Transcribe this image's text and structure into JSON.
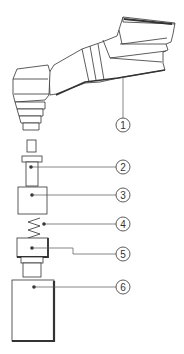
{
  "diagram": {
    "type": "exploded-assembly",
    "stroke_color": "#333333",
    "background": "#ffffff",
    "callouts": [
      {
        "id": 1,
        "label": "1",
        "target": "handpiece-body"
      },
      {
        "id": 2,
        "label": "2",
        "target": "push-button-cap"
      },
      {
        "id": 3,
        "label": "3",
        "target": "square-block"
      },
      {
        "id": 4,
        "label": "4",
        "target": "spring"
      },
      {
        "id": 5,
        "label": "5",
        "target": "threaded-fitting"
      },
      {
        "id": 6,
        "label": "6",
        "target": "rectangular-housing"
      }
    ]
  }
}
